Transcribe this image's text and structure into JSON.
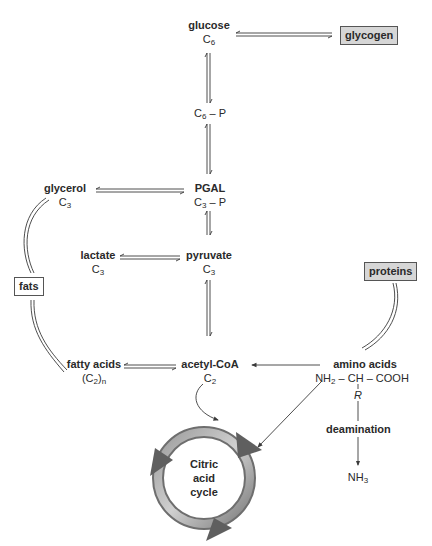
{
  "diagram": {
    "nodes": {
      "glucose": {
        "name": "glucose",
        "formula": "C",
        "formula_sub": "6"
      },
      "c6p": {
        "formula": "C",
        "formula_sub": "6",
        "formula_suffix": " – P"
      },
      "pgal": {
        "name": "PGAL",
        "formula": "C",
        "formula_sub": "3",
        "formula_suffix": " – P"
      },
      "glycerol": {
        "name": "glycerol",
        "formula": "C",
        "formula_sub": "3"
      },
      "lactate": {
        "name": "lactate",
        "formula": "C",
        "formula_sub": "3"
      },
      "pyruvate": {
        "name": "pyruvate",
        "formula": "C",
        "formula_sub": "3"
      },
      "fatty_acids": {
        "name": "fatty acids",
        "formula": "(C",
        "formula_sub": "2",
        "formula_suffix": ")",
        "formula_sub2": "n"
      },
      "acetyl_coa": {
        "name": "acetyl-CoA",
        "formula": "C",
        "formula_sub": "2"
      },
      "amino_acids": {
        "name": "amino acids",
        "formula_a": "NH",
        "formula_a_sub": "2",
        "formula_b": " – CH – COOH",
        "r_group": "R"
      },
      "deamination": {
        "name": "deamination"
      },
      "nh3": {
        "formula": "NH",
        "formula_sub": "3"
      }
    },
    "boxes": {
      "glycogen": "glycogen",
      "fats": "fats",
      "proteins": "proteins"
    },
    "cycle": {
      "line1": "Citric",
      "line2": "acid",
      "line3": "cycle"
    },
    "colors": {
      "line": "#3a3a3a",
      "box_fill": "#d6d6d6",
      "cycle_dark": "#6e6e6e",
      "cycle_light": "#c4c4c4"
    }
  }
}
